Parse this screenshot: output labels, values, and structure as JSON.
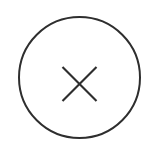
{
  "canvas": {
    "width": 149,
    "height": 152,
    "background_color": "#ffffff"
  },
  "icon_button": {
    "name": "close-button",
    "role": "button",
    "aria_label": "Close",
    "tooltip": "Close",
    "shape": "circle",
    "state": "default",
    "geometry": {
      "center_x": 79,
      "center_y": 77,
      "outer_diameter": 123,
      "radius": 60.5
    },
    "ring": {
      "icon_name": "circle-outline-icon",
      "stroke_color": "#2e2e2e",
      "stroke_width": 2,
      "fill": "none"
    },
    "glyph": {
      "icon_name": "close-x-icon",
      "character": "×",
      "stroke_color": "#2e2e2e",
      "stroke_width": 2.2,
      "arm_span": 34,
      "center_x": 79,
      "center_y": 83.5,
      "line_cap": "butt"
    }
  }
}
